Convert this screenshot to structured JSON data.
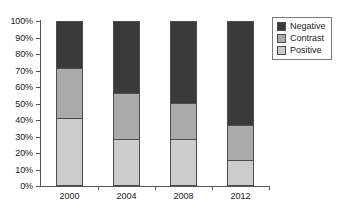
{
  "chart_data": {
    "type": "bar",
    "stacked": true,
    "stack_mode": "percent",
    "title": "",
    "subtitle": "",
    "xlabel": "",
    "ylabel": "",
    "categories": [
      "2000",
      "2004",
      "2008",
      "2012"
    ],
    "ylim": [
      0,
      100
    ],
    "y_tick_labels": [
      "0%",
      "10%",
      "20%",
      "30%",
      "40%",
      "50%",
      "60%",
      "70%",
      "80%",
      "90%",
      "100%"
    ],
    "y_tick_values": [
      0,
      10,
      20,
      30,
      40,
      50,
      60,
      70,
      80,
      90,
      100
    ],
    "grid": false,
    "legend_position": "top-right",
    "series": [
      {
        "name": "Positive",
        "color": "#cccccc",
        "values": [
          40.6,
          27.5,
          27.5,
          14.5
        ]
      },
      {
        "name": "Contrast",
        "color": "#aaaaaa",
        "values": [
          30.3,
          28.5,
          22.5,
          21.5
        ]
      },
      {
        "name": "Negative",
        "color": "#3a3a3a",
        "values": [
          29.1,
          44.0,
          50.0,
          64.0
        ]
      }
    ]
  },
  "legend": {
    "items": [
      {
        "label": "Negative",
        "color": "#3a3a3a"
      },
      {
        "label": "Contrast",
        "color": "#aaaaaa"
      },
      {
        "label": "Positive",
        "color": "#cccccc"
      }
    ]
  },
  "colors": {
    "negative": "#3a3a3a",
    "contrast": "#aaaaaa",
    "positive": "#cccccc",
    "axis": "#555555",
    "outline": "#4d4d4d",
    "text": "#1a1a1a",
    "background": "#ffffff"
  }
}
